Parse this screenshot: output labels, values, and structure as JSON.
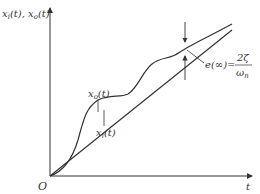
{
  "diagram": {
    "y_axis_label": "x",
    "y_axis_label_full": "xi(t), xo(t)",
    "y_label_parts": {
      "x1": "x",
      "s1": "i",
      "t1": "(t), ",
      "x2": "x",
      "s2": "o",
      "t2": "(t)"
    },
    "x_axis_label": "t",
    "origin_label": "O",
    "curve_input_label": {
      "base": "x",
      "sub": "i",
      "arg": "(t)"
    },
    "curve_output_label": {
      "base": "x",
      "sub": "o",
      "arg": "(t)"
    },
    "error_label": {
      "lhs": "e(∞)=",
      "numerator": "2ζ",
      "denominator": "ω",
      "den_sub": "n"
    },
    "colors": {
      "line": "#333333",
      "background": "#ffffff"
    }
  }
}
